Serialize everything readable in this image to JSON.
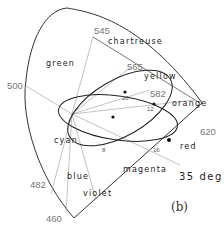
{
  "figure": {
    "panel_label": "(b)",
    "angle_label": "35 deg",
    "wavelength_labels": {
      "w545": "545",
      "w565": "565",
      "w582": "582",
      "w500": "500",
      "w620": "620",
      "w482": "482",
      "w460": "460"
    },
    "region_labels": {
      "green": "green",
      "chartreuse": "chartreuse",
      "yellow": "yellow",
      "orange": "orange",
      "cyan": "cyan",
      "red": "red",
      "blue": "blue",
      "violet": "violet",
      "magenta": "magenta"
    },
    "ellipse_markers": {
      "m20": "20",
      "m12": "12",
      "m8": "8",
      "m16": "16"
    }
  }
}
